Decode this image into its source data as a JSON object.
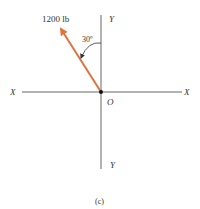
{
  "figure": {
    "force_label": "1200 lb",
    "angle_label": "30º",
    "axis_x_left": "X",
    "axis_x_right": "X",
    "axis_y_top": "Y",
    "axis_y_bottom": "Y",
    "origin_label": "O",
    "caption": "(c)",
    "colors": {
      "force_arrow": "#e0733e",
      "axis": "#555555",
      "text": "#333333"
    },
    "force": {
      "magnitude": 1200,
      "unit": "lb",
      "angle_from_y_deg": 30,
      "direction": "up-left"
    }
  }
}
